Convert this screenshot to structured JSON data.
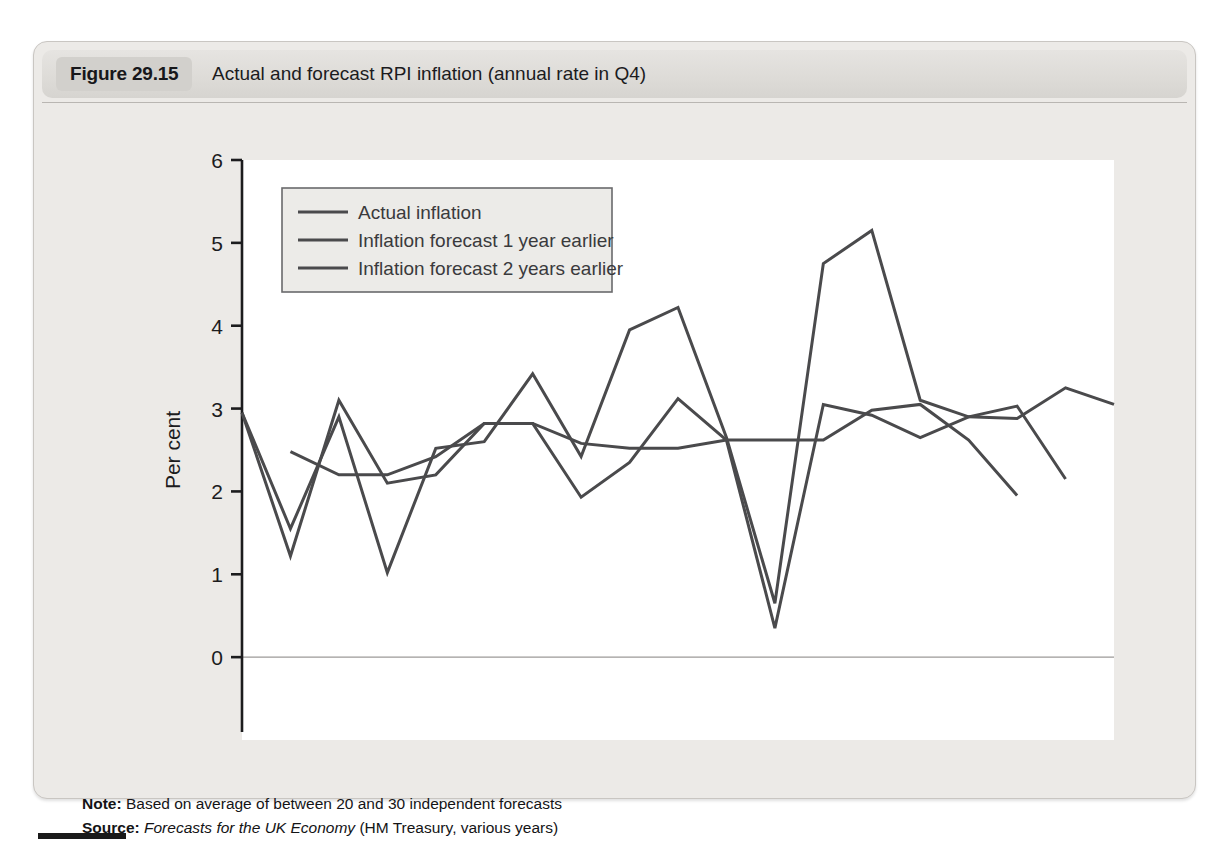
{
  "figure": {
    "tag": "Figure 29.15",
    "caption": "Actual and forecast RPI inflation (annual rate in Q4)"
  },
  "notes": {
    "note_label": "Note:",
    "note_text": "Based on average of between 20 and 30 independent forecasts",
    "source_label": "Source:",
    "source_italic": "Forecasts for the UK Economy",
    "source_rest": "(HM Treasury, various years)"
  },
  "colors": {
    "line": "#4a4a4c",
    "axis": "#1c1c1e",
    "panel_bg": "#eceae7",
    "plot_bg": "#ffffff",
    "header_bg": "#dddbd7",
    "tag_bg": "#d2d0cc",
    "zero_line": "#9c9a98"
  },
  "chart_data": {
    "type": "line",
    "title": "Actual and forecast RPI inflation (annual rate in Q4)",
    "xlabel": "",
    "ylabel": "Per cent",
    "xlim": [
      1998,
      2016
    ],
    "ylim": [
      -1,
      6
    ],
    "yticks": [
      -1,
      0,
      1,
      2,
      3,
      4,
      5,
      6
    ],
    "xticks": [
      1998,
      1999,
      2000,
      2001,
      2002,
      2003,
      2004,
      2005,
      2006,
      2007,
      2008,
      2009,
      2010,
      2011,
      2012,
      2013,
      2014,
      2015,
      2016
    ],
    "xtick_labels": [
      "1998",
      "",
      "2000",
      "",
      "2002",
      "",
      "2004",
      "",
      "2006",
      "",
      "2008",
      "",
      "2010",
      "",
      "2012",
      "",
      "2014",
      "",
      "2016"
    ],
    "grid": false,
    "legend_position": "top-left",
    "zero_line": 0,
    "series": [
      {
        "name": "Actual inflation",
        "x": [
          1998,
          1999,
          2000,
          2001,
          2002,
          2003,
          2004,
          2005,
          2006,
          2007,
          2008,
          2009,
          2010,
          2011,
          2012,
          2013,
          2014,
          2015,
          2016
        ],
        "values": [
          2.95,
          1.55,
          2.9,
          1.02,
          2.52,
          2.6,
          3.42,
          2.42,
          3.95,
          4.22,
          2.65,
          0.65,
          4.75,
          5.15,
          3.1,
          2.9,
          2.88,
          3.25,
          3.05
        ]
      },
      {
        "name": "Inflation forecast 1 year earlier",
        "x": [
          1998,
          1999,
          2000,
          2001,
          2002,
          2003,
          2004,
          2005,
          2006,
          2007,
          2008,
          2009,
          2010,
          2011,
          2012,
          2013,
          2014,
          2015
        ],
        "values": [
          2.95,
          1.22,
          3.1,
          2.1,
          2.2,
          2.82,
          2.82,
          1.93,
          2.35,
          3.12,
          2.62,
          0.35,
          3.05,
          2.92,
          2.65,
          2.9,
          3.03,
          2.15
        ]
      },
      {
        "name": "Inflation forecast 2 years earlier",
        "x": [
          1999,
          2000,
          2001,
          2002,
          2003,
          2004,
          2005,
          2006,
          2007,
          2008,
          2009,
          2010,
          2011,
          2012,
          2013,
          2014
        ],
        "values": [
          2.48,
          2.2,
          2.2,
          2.42,
          2.82,
          2.82,
          2.58,
          2.52,
          2.52,
          2.62,
          2.62,
          2.62,
          2.98,
          3.05,
          2.62,
          1.95
        ]
      }
    ]
  },
  "legend": {
    "items": [
      {
        "label": "Actual inflation"
      },
      {
        "label": "Inflation forecast 1 year earlier"
      },
      {
        "label": "Inflation forecast 2 years earlier"
      }
    ]
  }
}
